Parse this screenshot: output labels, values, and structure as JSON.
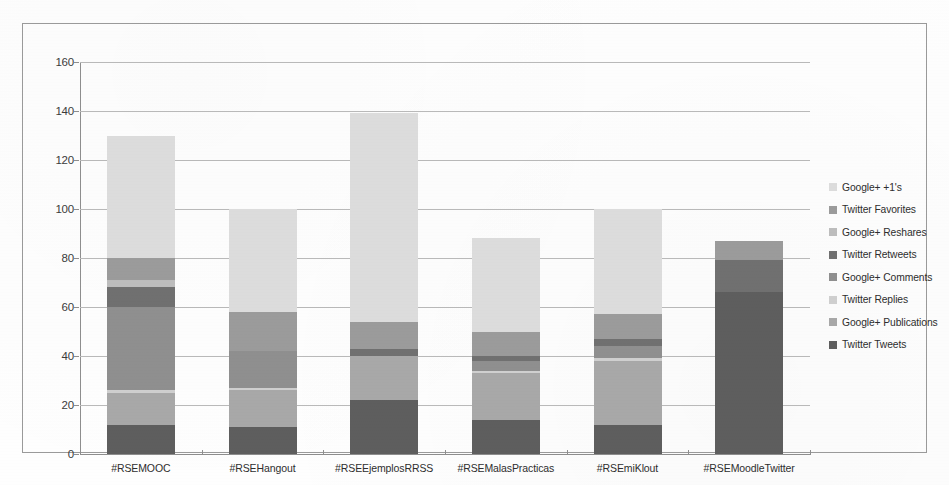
{
  "chart_data": {
    "type": "bar",
    "subtype": "stacked-bar",
    "title": "",
    "xlabel": "",
    "ylabel": "",
    "ylim": [
      0,
      160
    ],
    "yticks": [
      0,
      20,
      40,
      60,
      80,
      100,
      120,
      140,
      160
    ],
    "grid": true,
    "legend_position": "right",
    "categories": [
      "#RSEMOOC",
      "#RSEHangout",
      "#RSEEjemplosRRSS",
      "#RSEMalasPracticas",
      "#RSEmiKlout",
      "#RSEMoodleTwitter"
    ],
    "series": [
      {
        "name": "Twitter Tweets",
        "color": "#5e5e5e",
        "values": [
          12,
          11,
          22,
          14,
          12,
          66
        ]
      },
      {
        "name": "Google+ Publications",
        "color": "#a8a8a8",
        "values": [
          13,
          15,
          18,
          19,
          26,
          0
        ]
      },
      {
        "name": "Twitter Replies",
        "color": "#cfcfcf",
        "values": [
          1,
          1,
          0,
          1,
          1,
          0
        ]
      },
      {
        "name": "Google+ Comments",
        "color": "#8f8f8f",
        "values": [
          34,
          15,
          0,
          4,
          5,
          0
        ]
      },
      {
        "name": "Twitter Retweets",
        "color": "#707070",
        "values": [
          8,
          0,
          3,
          2,
          3,
          13
        ]
      },
      {
        "name": "Google+ Reshares",
        "color": "#bdbdbd",
        "values": [
          3,
          0,
          0,
          0,
          0,
          0
        ]
      },
      {
        "name": "Twitter Favorites",
        "color": "#9b9b9b",
        "values": [
          9,
          16,
          11,
          10,
          10,
          8
        ]
      },
      {
        "name": "Google+ +1's",
        "color": "#dcdcdc",
        "values": [
          50,
          42,
          85,
          38,
          43,
          0
        ]
      }
    ],
    "totals": [
      130,
      100,
      139,
      88,
      100,
      87
    ]
  },
  "legend": {
    "items": [
      {
        "label": "Google+ +1's",
        "color": "#dcdcdc"
      },
      {
        "label": "Twitter Favorites",
        "color": "#9b9b9b"
      },
      {
        "label": "Google+ Reshares",
        "color": "#bdbdbd"
      },
      {
        "label": "Twitter Retweets",
        "color": "#707070"
      },
      {
        "label": "Google+ Comments",
        "color": "#8f8f8f"
      },
      {
        "label": "Twitter Replies",
        "color": "#cfcfcf"
      },
      {
        "label": "Google+ Publications",
        "color": "#a8a8a8"
      },
      {
        "label": "Twitter Tweets",
        "color": "#5e5e5e"
      }
    ]
  }
}
